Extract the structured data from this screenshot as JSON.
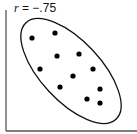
{
  "chart_data": {
    "type": "scatter",
    "title": "",
    "annotation": {
      "var": "r",
      "eq": " = ",
      "value": "−.75"
    },
    "xlabel": "",
    "ylabel": "",
    "grid": false,
    "legend": null,
    "points_px": [
      [
        32,
        38
      ],
      [
        55,
        33
      ],
      [
        57,
        56
      ],
      [
        79,
        54
      ],
      [
        40,
        69
      ],
      [
        93,
        69
      ],
      [
        73,
        76
      ],
      [
        60,
        87
      ],
      [
        100,
        89
      ],
      [
        87,
        99
      ],
      [
        100,
        103
      ]
    ],
    "ellipse": {
      "cx": 71,
      "cy": 71,
      "rx": 66,
      "ry": 30,
      "rotation_deg": 47
    },
    "correlation": -0.75
  }
}
